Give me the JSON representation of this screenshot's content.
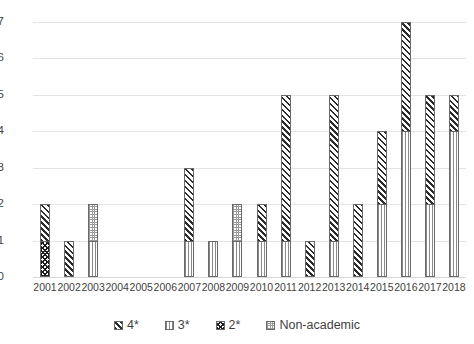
{
  "chart_data": {
    "type": "bar",
    "subtype": "stacked-vertical",
    "title": "",
    "xlabel": "",
    "ylabel": "",
    "ylim": [
      0,
      7
    ],
    "yticks": [
      0,
      1,
      2,
      3,
      4,
      5,
      6,
      7
    ],
    "ytick_labels": [
      "0",
      "1",
      "2",
      "3",
      "4",
      "5",
      "6",
      "7"
    ],
    "grid": true,
    "grid_axis": "y",
    "legend_position": "bottom",
    "categories": [
      "2001",
      "2002",
      "2003",
      "2004",
      "2005",
      "2006",
      "2007",
      "2008",
      "2009",
      "2010",
      "2011",
      "2012",
      "2013",
      "2014",
      "2015",
      "2016",
      "2017",
      "2018"
    ],
    "series": [
      {
        "name": "2*",
        "pattern": "checkered",
        "color": "#1f1f1f",
        "values": [
          1,
          0,
          0,
          0,
          0,
          0,
          0,
          0,
          0,
          0,
          0,
          0,
          0,
          0,
          0,
          0,
          0,
          0
        ]
      },
      {
        "name": "3*",
        "pattern": "vertical-lines",
        "color": "#888888",
        "values": [
          0,
          0,
          1,
          0,
          0,
          0,
          1,
          1,
          1,
          1,
          1,
          0,
          1,
          0,
          2,
          4,
          2,
          4
        ]
      },
      {
        "name": "Non-academic",
        "pattern": "dotted",
        "color": "#9a9a9a",
        "values": [
          0,
          0,
          1,
          0,
          0,
          0,
          0,
          0,
          1,
          0,
          0,
          0,
          0,
          0,
          0,
          0,
          0,
          0
        ]
      },
      {
        "name": "4*",
        "pattern": "diagonal-hatch",
        "color": "#2b2b2b",
        "values": [
          1,
          1,
          0,
          0,
          0,
          0,
          2,
          0,
          0,
          1,
          4,
          1,
          4,
          2,
          2,
          3,
          3,
          1
        ]
      }
    ],
    "totals": [
      2,
      1,
      2,
      0,
      0,
      0,
      3,
      1,
      2,
      2,
      5,
      1,
      5,
      2,
      4,
      7,
      5,
      5
    ],
    "stack_order": [
      "2*",
      "3*",
      "Non-academic",
      "4*"
    ]
  },
  "legend": {
    "items": [
      {
        "label": "4*",
        "pattern": "diagonal-hatch"
      },
      {
        "label": "3*",
        "pattern": "vertical-lines"
      },
      {
        "label": "2*",
        "pattern": "checkered"
      },
      {
        "label": "Non-academic",
        "pattern": "dotted"
      }
    ]
  },
  "colors": {
    "gridline": "#e4e4e4",
    "axis_text": "#3f3f3f",
    "bar_outline": "#6a6a6a",
    "background": "#ffffff"
  }
}
